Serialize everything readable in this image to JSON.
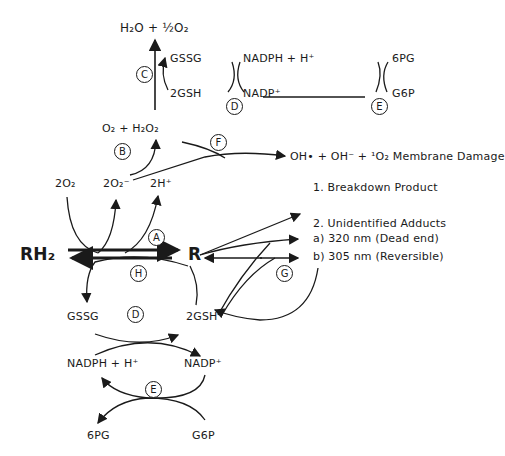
{
  "top": {
    "product": "H₂O + ½O₂",
    "gssg": "GSSG",
    "gsh": "2GSH",
    "nadph": "NADPH + H⁺",
    "nadp": "NADP⁺",
    "pg": "6PG",
    "g6p": "G6P"
  },
  "superoxide": {
    "o2_h2o2": "O₂ + H₂O₂",
    "two_o2": "2O₂",
    "two_o2_radical": "2O₂⁻",
    "two_h": "2H⁺",
    "membrane_damage": "OH• + OH⁻ + ¹O₂   Membrane Damage"
  },
  "main": {
    "rh2": "RH₂",
    "r": "R"
  },
  "products": {
    "breakdown": "1. Breakdown Product",
    "adducts_title": "2. Unidentified Adducts",
    "adduct_a": "a) 320 nm  (Dead end)",
    "adduct_b": "b) 305 nm  (Reversible)"
  },
  "bottom": {
    "gssg": "GSSG",
    "gsh": "2GSH",
    "nadph": "NADPH + H⁺",
    "nadp": "NADP⁺",
    "pg": "6PG",
    "g6p": "G6P"
  },
  "labels": {
    "A": "A",
    "B": "B",
    "C": "C",
    "D_top": "D",
    "E_top": "E",
    "F": "F",
    "G": "G",
    "H": "H",
    "D_bottom": "D",
    "E_bottom": "E"
  }
}
